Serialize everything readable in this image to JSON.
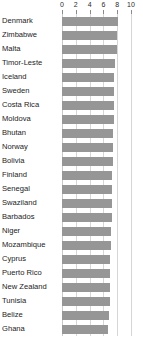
{
  "chart_data": {
    "type": "bar",
    "orientation": "horizontal",
    "title": "",
    "subtitle": "",
    "xlabel": "",
    "ylabel": "",
    "xlim": [
      0,
      10
    ],
    "ticks": [
      0,
      2,
      4,
      6,
      8,
      10
    ],
    "tick_labels": [
      "0",
      "2",
      "4",
      "6",
      "8",
      "10"
    ],
    "grid": true,
    "grid_axis": "x",
    "legend": false,
    "bar_color": "#969696",
    "gridline_color": "#d6d6d6",
    "categories": [
      "Denmark",
      "Zimbabwe",
      "Malta",
      "Timor-Leste",
      "Iceland",
      "Sweden",
      "Costa Rica",
      "Moldova",
      "Bhutan",
      "Norway",
      "Bolivia",
      "Finland",
      "Senegal",
      "Swaziland",
      "Barbados",
      "Niger",
      "Mozambique",
      "Cyprus",
      "Puerto Rico",
      "New Zealand",
      "Tunisia",
      "Belize",
      "Ghana"
    ],
    "values": [
      8.1,
      8.0,
      8.0,
      7.7,
      7.6,
      7.6,
      7.5,
      7.5,
      7.4,
      7.4,
      7.4,
      7.3,
      7.3,
      7.2,
      7.2,
      7.1,
      7.1,
      7.0,
      7.0,
      6.9,
      6.9,
      6.8,
      6.7
    ]
  }
}
